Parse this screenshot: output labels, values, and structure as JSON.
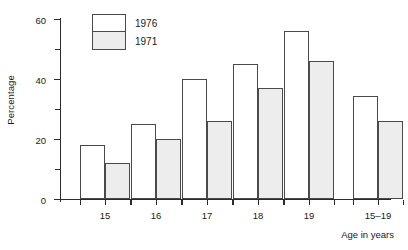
{
  "chart_data": {
    "type": "bar",
    "title": "",
    "xlabel": "Age in years",
    "ylabel": "Percentage",
    "categories": [
      "15",
      "16",
      "17",
      "18",
      "19",
      "15–19"
    ],
    "series": [
      {
        "name": "1976",
        "values": [
          18,
          25,
          40,
          45,
          56,
          34.5
        ],
        "color": "#ffffff"
      },
      {
        "name": "1971",
        "values": [
          12,
          20,
          26,
          37,
          46,
          26
        ],
        "color": "#ededed"
      }
    ],
    "ylim": [
      0,
      60
    ],
    "ymajor_ticks": [
      0,
      20,
      40,
      60
    ],
    "yminor_ticks": [
      10,
      30,
      50
    ],
    "ytick_labels": [
      "0",
      "20",
      "40",
      "60"
    ],
    "grid": false,
    "legend_position": "top-left-inside"
  },
  "axes": {
    "y_title": "Percentage",
    "x_title": "Age in years",
    "y_labels": [
      "60",
      "40",
      "20",
      "0"
    ]
  },
  "legend": {
    "entries": [
      {
        "label": "1976",
        "swatch_color": "#ffffff"
      },
      {
        "label": "1971",
        "swatch_color": "#ededed"
      }
    ]
  },
  "x_categories": [
    "15",
    "16",
    "17",
    "18",
    "19",
    "15–19"
  ]
}
